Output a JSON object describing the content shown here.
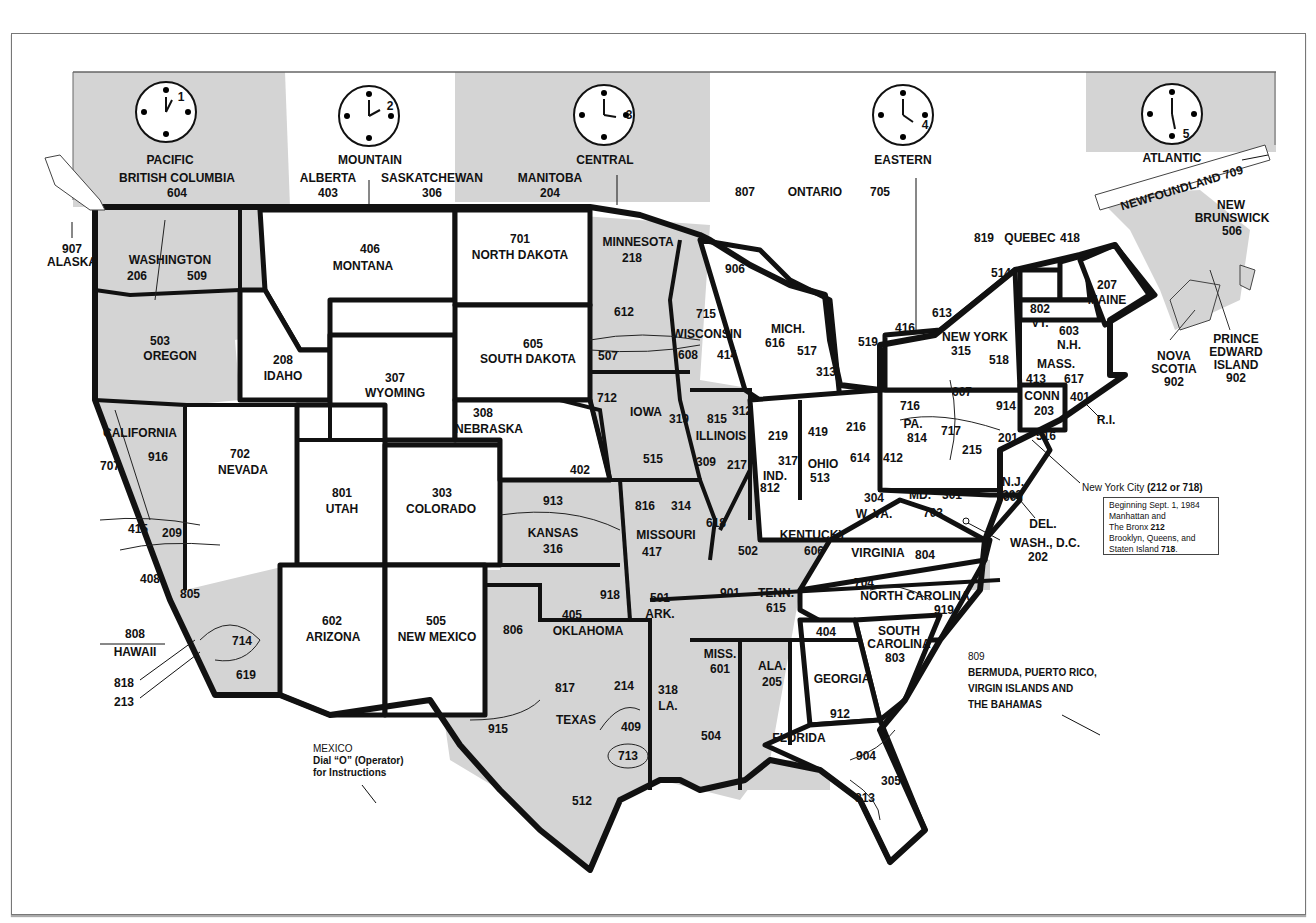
{
  "map": {
    "title_implied": "U.S. and Canada Area Codes and Time Zones",
    "colors": {
      "shaded": "#d4d4d4",
      "border": "#111111",
      "background": "#ffffff"
    },
    "time_zones": [
      {
        "name": "PACIFIC",
        "clock_hour": "1"
      },
      {
        "name": "MOUNTAIN",
        "clock_hour": "2"
      },
      {
        "name": "CENTRAL",
        "clock_hour": "3"
      },
      {
        "name": "EASTERN",
        "clock_hour": "4"
      },
      {
        "name": "ATLANTIC",
        "clock_hour": "5"
      }
    ],
    "canada": {
      "british_columbia": {
        "name": "BRITISH COLUMBIA",
        "code": "604"
      },
      "alberta": {
        "name": "ALBERTA",
        "code": "403"
      },
      "saskatchewan": {
        "name": "SASKATCHEWAN",
        "code": "306"
      },
      "manitoba": {
        "name": "MANITOBA",
        "code": "204"
      },
      "ontario": {
        "name": "ONTARIO",
        "codes": [
          "807",
          "705",
          "416",
          "519",
          "613"
        ]
      },
      "quebec": {
        "name": "QUEBEC",
        "codes": [
          "819",
          "418",
          "514"
        ]
      },
      "newfoundland": {
        "name": "NEWFOUNDLAND 709"
      },
      "new_brunswick": {
        "name1": "NEW",
        "name2": "BRUNSWICK",
        "code": "506"
      },
      "nova_scotia": {
        "name1": "NOVA",
        "name2": "SCOTIA",
        "code": "902"
      },
      "pei": {
        "name1": "PRINCE",
        "name2": "EDWARD",
        "name3": "ISLAND",
        "code": "902"
      }
    },
    "states": {
      "alaska": {
        "name": "ALASKA",
        "code": "907"
      },
      "hawaii": {
        "name": "HAWAII",
        "code": "808"
      },
      "washington": {
        "name": "WASHINGTON",
        "codes": [
          "206",
          "509"
        ]
      },
      "oregon": {
        "name": "OREGON",
        "code": "503"
      },
      "california": {
        "name": "CALIFORNIA",
        "codes": [
          "707",
          "916",
          "415",
          "209",
          "408",
          "805",
          "714",
          "619",
          "818",
          "213"
        ]
      },
      "nevada": {
        "name": "NEVADA",
        "code": "702"
      },
      "idaho": {
        "name": "IDAHO",
        "code": "208"
      },
      "montana": {
        "name": "MONTANA",
        "code": "406"
      },
      "wyoming": {
        "name": "WYOMING",
        "code": "307"
      },
      "utah": {
        "name": "UTAH",
        "code": "801"
      },
      "colorado": {
        "name": "COLORADO",
        "code": "303"
      },
      "arizona": {
        "name": "ARIZONA",
        "code": "602"
      },
      "new_mexico": {
        "name": "NEW MEXICO",
        "code": "505"
      },
      "north_dakota": {
        "name": "NORTH DAKOTA",
        "code": "701"
      },
      "south_dakota": {
        "name": "SOUTH DAKOTA",
        "code": "605"
      },
      "nebraska": {
        "name": "NEBRASKA",
        "codes": [
          "308",
          "402"
        ]
      },
      "kansas": {
        "name": "KANSAS",
        "codes": [
          "913",
          "316"
        ]
      },
      "oklahoma": {
        "name": "OKLAHOMA",
        "codes": [
          "405",
          "918"
        ]
      },
      "texas": {
        "name": "TEXAS",
        "codes": [
          "806",
          "817",
          "214",
          "915",
          "409",
          "713",
          "512"
        ]
      },
      "minnesota": {
        "name": "MINNESOTA",
        "codes": [
          "218",
          "612",
          "507"
        ]
      },
      "iowa": {
        "name": "IOWA",
        "codes": [
          "712",
          "319",
          "515"
        ]
      },
      "missouri": {
        "name": "MISSOURI",
        "codes": [
          "816",
          "314",
          "417"
        ]
      },
      "arkansas": {
        "name": "ARK.",
        "code": "501"
      },
      "louisiana": {
        "name": "LA.",
        "codes": [
          "318",
          "504"
        ]
      },
      "wisconsin": {
        "name": "WISCONSIN",
        "codes": [
          "715",
          "608",
          "414"
        ]
      },
      "illinois": {
        "name": "ILLINOIS",
        "codes": [
          "815",
          "312",
          "309",
          "217",
          "618"
        ]
      },
      "michigan": {
        "name": "MICH.",
        "codes": [
          "906",
          "616",
          "517",
          "313"
        ]
      },
      "indiana": {
        "name": "IND.",
        "codes": [
          "219",
          "317",
          "812"
        ]
      },
      "ohio": {
        "name": "OHIO",
        "codes": [
          "419",
          "216",
          "614",
          "513"
        ]
      },
      "kentucky": {
        "name": "KENTUCKY",
        "codes": [
          "502",
          "606"
        ]
      },
      "tennessee": {
        "name": "TENN.",
        "codes": [
          "901",
          "615"
        ]
      },
      "mississippi": {
        "name": "MISS.",
        "code": "601"
      },
      "alabama": {
        "name": "ALA.",
        "code": "205"
      },
      "georgia": {
        "name": "GEORGIA",
        "codes": [
          "404",
          "912"
        ]
      },
      "florida": {
        "name": "FLORIDA",
        "codes": [
          "904",
          "305",
          "813"
        ]
      },
      "south_carolina": {
        "name1": "SOUTH",
        "name2": "CAROLINA",
        "code": "803"
      },
      "north_carolina": {
        "name": "NORTH CAROLINA",
        "codes": [
          "704",
          "919"
        ]
      },
      "virginia": {
        "name": "VIRGINIA",
        "codes": [
          "703",
          "804"
        ]
      },
      "west_virginia": {
        "name": "W. VA.",
        "code": "304"
      },
      "maryland": {
        "name": "MD.",
        "code": "301"
      },
      "delaware": {
        "name": "DEL.",
        "code": "302"
      },
      "dc": {
        "name": "WASH., D.C.",
        "code": "202"
      },
      "pennsylvania": {
        "name": "PA.",
        "codes": [
          "412",
          "814",
          "717",
          "215"
        ]
      },
      "new_jersey": {
        "name": "N.J.",
        "codes": [
          "201",
          "609"
        ]
      },
      "new_york": {
        "name": "NEW YORK",
        "codes": [
          "716",
          "315",
          "518",
          "607",
          "914",
          "516"
        ]
      },
      "vermont": {
        "name": "VT.",
        "code": "802"
      },
      "new_hampshire": {
        "name": "N.H.",
        "code": "603"
      },
      "maine": {
        "name": "MAINE",
        "code": "207"
      },
      "massachusetts": {
        "name": "MASS.",
        "codes": [
          "413",
          "617"
        ]
      },
      "connecticut": {
        "name": "CONN",
        "code": "203"
      },
      "rhode_island": {
        "name": "R.I.",
        "code": "401"
      }
    },
    "notes": {
      "nyc": {
        "label": "New York City",
        "codes": "(212 or 718)"
      },
      "nyc_box": {
        "line1": "Beginning Sept. 1, 1984",
        "line2": "Manhattan and",
        "line3a": "The Bronx",
        "line3b": "212",
        "line4": "Brooklyn, Queens, and",
        "line5a": "Staten Island",
        "line5b": "718"
      },
      "caribbean": {
        "code": "809",
        "line1": "BERMUDA, PUERTO RICO,",
        "line2": "VIRGIN ISLANDS AND",
        "line3": "THE BAHAMAS"
      },
      "mexico": {
        "line1": "MEXICO",
        "line2": "Dial “O” (Operator)",
        "line3": "for Instructions"
      }
    }
  }
}
